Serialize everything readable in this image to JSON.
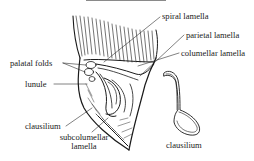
{
  "figure": {
    "type": "anatomical diagram",
    "colors": {
      "ink": "#1a1a1a",
      "background": "#ffffff"
    },
    "labels": {
      "spiral_lamella": "spiral lamella",
      "parietal_lamella": "parietal lamella",
      "columellar_lamella": "columellar lamella",
      "palatal_folds": "palatal folds",
      "lunule": "lunule",
      "clausilium_shell": "clausilium",
      "subcolumellar_line1": "subcolumellar",
      "subcolumellar_line2": "lamella",
      "clausilium_detail": "clausilium"
    }
  }
}
